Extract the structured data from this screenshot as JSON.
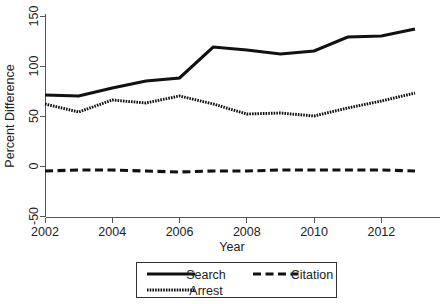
{
  "chart_data": {
    "type": "line",
    "title": "",
    "xlabel": "Year",
    "ylabel": "Percent Difference",
    "x": [
      2002,
      2003,
      2004,
      2005,
      2006,
      2007,
      2008,
      2009,
      2010,
      2011,
      2012,
      2013
    ],
    "xlim": [
      2002,
      2013
    ],
    "ylim": [
      -50,
      150
    ],
    "xticks": [
      2002,
      2004,
      2006,
      2008,
      2010,
      2012
    ],
    "xticklabels": [
      "2002",
      "2004",
      "2006",
      "2008",
      "2010",
      "2012"
    ],
    "yticks": [
      -50,
      0,
      50,
      100,
      150
    ],
    "yticklabels": [
      "-50",
      "0",
      "50",
      "100",
      "150"
    ],
    "grid": false,
    "legend_position": "bottom",
    "series": [
      {
        "name": "Search",
        "style": "solid",
        "color": "#111111",
        "values": [
          71,
          70,
          78,
          85,
          88,
          119,
          116,
          112,
          115,
          129,
          130,
          137
        ]
      },
      {
        "name": "Citation",
        "style": "dashed",
        "color": "#111111",
        "values": [
          -5,
          -4,
          -4,
          -5,
          -6,
          -5,
          -5,
          -4,
          -4,
          -4,
          -4,
          -5
        ]
      },
      {
        "name": "Arrest",
        "style": "dotted",
        "color": "#111111",
        "values": [
          62,
          54,
          66,
          63,
          70,
          62,
          52,
          53,
          50,
          58,
          65,
          73
        ]
      }
    ]
  },
  "legend": {
    "entries": [
      {
        "label": "Search",
        "style": "solid"
      },
      {
        "label": "Citation",
        "style": "dashed"
      },
      {
        "label": "Arrest",
        "style": "dotted"
      }
    ]
  }
}
